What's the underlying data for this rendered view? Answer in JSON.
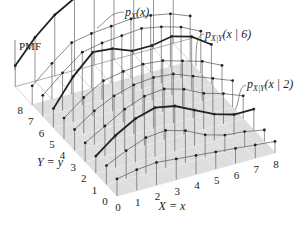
{
  "title_labels": {
    "pmf": "PMF",
    "marginal": "p_X(x)",
    "cond6": "p_X|Y(x | 6)",
    "cond2": "p_X|Y(x | 2)",
    "x_axis": "X = x",
    "y_axis": "Y = y"
  },
  "axes": {
    "x_ticks": [
      "0",
      "1",
      "2",
      "3",
      "4",
      "5",
      "6",
      "7",
      "8"
    ],
    "y_ticks": [
      "0",
      "1",
      "2",
      "3",
      "4",
      "5",
      "6",
      "7",
      "8"
    ]
  },
  "geometry": {
    "origin": [
      117,
      196
    ],
    "x_unit": [
      19.75,
      -5.4
    ],
    "y_unit": [
      -10.6,
      -11.4
    ],
    "z_scale": 38,
    "plane_fill": "#dedede",
    "line_color": "#555555",
    "highlight_color": "#222222"
  },
  "conditional_rows": [
    {
      "y": 0,
      "heights": [
        0.45,
        0.55,
        0.6,
        0.55,
        0.5,
        0.45,
        0.4,
        0.35,
        0.3
      ]
    },
    {
      "y": 1,
      "heights": [
        0.5,
        0.75,
        0.95,
        1.0,
        0.85,
        0.6,
        0.45,
        0.4,
        0.3
      ]
    },
    {
      "y": 2,
      "heights": [
        0.45,
        0.85,
        1.15,
        1.3,
        1.2,
        0.95,
        0.7,
        0.55,
        0.55
      ],
      "highlight": true,
      "label": "cond2"
    },
    {
      "y": 3,
      "heights": [
        0.5,
        0.8,
        1.1,
        1.3,
        1.35,
        1.2,
        0.95,
        0.8,
        0.6
      ]
    },
    {
      "y": 4,
      "heights": [
        0.55,
        0.9,
        1.15,
        1.3,
        1.35,
        1.3,
        1.1,
        0.9,
        0.7
      ]
    },
    {
      "y": 5,
      "heights": [
        0.55,
        0.95,
        1.25,
        1.35,
        1.4,
        1.35,
        1.2,
        1.05,
        0.8
      ]
    },
    {
      "y": 6,
      "heights": [
        0.5,
        1.2,
        1.7,
        1.65,
        1.45,
        1.45,
        1.55,
        1.4,
        1.05
      ],
      "highlight": true,
      "label": "cond6"
    },
    {
      "y": 7,
      "heights": [
        0.55,
        1.0,
        1.4,
        1.5,
        1.55,
        1.6,
        1.5,
        1.35,
        1.1
      ]
    },
    {
      "y": 8,
      "heights": [
        0.5,
        0.95,
        1.35,
        1.45,
        1.5,
        1.55,
        1.5,
        1.4,
        1.2
      ]
    }
  ],
  "marginal": {
    "y_offset": 9.6,
    "heights": [
      0.55,
      1.15,
      1.6,
      1.9,
      2.05,
      2.15,
      2.15,
      2.2,
      2.2
    ]
  }
}
